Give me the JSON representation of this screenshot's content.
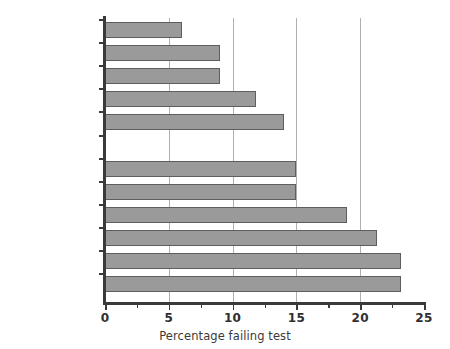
{
  "chart_data": {
    "type": "bar",
    "orientation": "horizontal",
    "title": "",
    "xlabel": "Percentage failing test",
    "ylabel": "",
    "xlim": [
      0,
      25
    ],
    "xticks": [
      0,
      5,
      10,
      15,
      20,
      25
    ],
    "xtick_labels": [
      "0",
      "5",
      "10",
      "15",
      "20",
      "25"
    ],
    "minor_xticks": [
      2.5,
      7.5,
      12.5,
      17.5,
      22.5
    ],
    "grid": "vertical gridlines at 5, 10, 15, 20",
    "legend": "none",
    "categories": [
      "Sweden",
      "Germany",
      "The Netherlands",
      "Switzerland",
      "Belgium",
      "",
      "Australia",
      "Canada",
      "New Zealand",
      "United Kingdom",
      "United States",
      "Ireland"
    ],
    "values": [
      6.0,
      9.0,
      9.0,
      11.8,
      14.0,
      null,
      15.0,
      15.0,
      19.0,
      21.3,
      23.2,
      23.2
    ],
    "bars": [
      {
        "label": "Sweden",
        "value": 6.0
      },
      {
        "label": "Germany",
        "value": 9.0
      },
      {
        "label": "The Netherlands",
        "value": 9.0
      },
      {
        "label": "Switzerland",
        "value": 11.8
      },
      {
        "label": "Belgium",
        "value": 14.0
      },
      {
        "label": "",
        "value": null
      },
      {
        "label": "Australia",
        "value": 15.0
      },
      {
        "label": "Canada",
        "value": 15.0
      },
      {
        "label": "New Zealand",
        "value": 19.0
      },
      {
        "label": "United Kingdom",
        "value": 21.3
      },
      {
        "label": "United States",
        "value": 23.2
      },
      {
        "label": "Ireland",
        "value": 23.2
      }
    ],
    "colors": {
      "bar_fill": "#9a9a9a",
      "bar_edge": "#5e5e5e",
      "axis": "#3a3a3a",
      "gridline": "#b0b0b0",
      "text": "#3a3a3a",
      "background": "#ffffff"
    }
  }
}
